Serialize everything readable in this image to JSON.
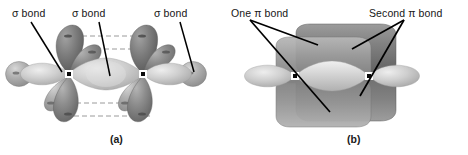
{
  "figure": {
    "background_color": "#ffffff",
    "rendering": "grayscale"
  },
  "panels": [
    {
      "id": "a",
      "caption": "(a)",
      "caption_x": 110,
      "caption_y": 134,
      "description": "sp hybrid orbitals forming three sigma bonds along the molecular axis, with unhybridized p orbitals shown above and below",
      "labels": [
        {
          "text": "σ bond",
          "x": 12,
          "y": 8,
          "leader_to_x": 66,
          "leader_to_y": 74
        },
        {
          "text": "σ bond",
          "x": 72,
          "y": 8,
          "leader_to_x": 106,
          "leader_to_y": 78
        },
        {
          "text": "σ bond",
          "x": 155,
          "y": 8,
          "leader_to_x": 190,
          "leader_to_y": 74
        }
      ],
      "nuclei": [
        {
          "x": 69,
          "y": 74
        },
        {
          "x": 143,
          "y": 74
        }
      ],
      "sigma_lobes": [
        {
          "name": "terminal-hydrogen-left",
          "cx": 19,
          "cy": 74,
          "rx": 13,
          "ry": 12,
          "shade": "#9d9d9d"
        },
        {
          "name": "sp-lobe-left-outer",
          "cx": 44,
          "cy": 74,
          "rx": 22,
          "ry": 14,
          "shade": "#c2c2c2"
        },
        {
          "name": "sp-lobe-center-left",
          "cx": 92,
          "cy": 75,
          "rx": 25,
          "ry": 14,
          "shade": "#c8c8c8"
        },
        {
          "name": "sp-lobe-center-right",
          "cx": 120,
          "cy": 75,
          "rx": 25,
          "ry": 14,
          "shade": "#c8c8c8"
        },
        {
          "name": "sp-lobe-right-outer",
          "cx": 168,
          "cy": 74,
          "rx": 22,
          "ry": 14,
          "shade": "#c2c2c2"
        },
        {
          "name": "terminal-hydrogen-right",
          "cx": 193,
          "cy": 74,
          "rx": 13,
          "ry": 12,
          "shade": "#9d9d9d"
        }
      ],
      "p_orbitals": [
        {
          "name": "p-left-upper-back",
          "cx": 66,
          "cy": 48,
          "tilt": -12,
          "shade": "#6f6f6f"
        },
        {
          "name": "p-left-upper-front",
          "cx": 82,
          "cy": 55,
          "tilt": 18,
          "shade": "#8a8a8a"
        },
        {
          "name": "p-left-lower-front",
          "cx": 70,
          "cy": 100,
          "tilt": 12,
          "shade": "#7a7a7a"
        },
        {
          "name": "p-left-lower-back",
          "cx": 55,
          "cy": 95,
          "tilt": -16,
          "shade": "#8d8d8d"
        },
        {
          "name": "p-right-upper-back",
          "cx": 140,
          "cy": 48,
          "tilt": -12,
          "shade": "#6f6f6f"
        },
        {
          "name": "p-right-upper-front",
          "cx": 156,
          "cy": 55,
          "tilt": 18,
          "shade": "#8a8a8a"
        },
        {
          "name": "p-right-lower-front",
          "cx": 144,
          "cy": 100,
          "tilt": 12,
          "shade": "#7a7a7a"
        },
        {
          "name": "p-right-lower-back",
          "cx": 129,
          "cy": 95,
          "tilt": -16,
          "shade": "#8d8d8d"
        }
      ],
      "dashed_connectors": [
        {
          "x1": 74,
          "y1": 36,
          "x2": 148,
          "y2": 36
        },
        {
          "x1": 88,
          "y1": 48,
          "x2": 162,
          "y2": 48
        },
        {
          "x1": 62,
          "y1": 102,
          "x2": 136,
          "y2": 102
        },
        {
          "x1": 76,
          "y1": 115,
          "x2": 150,
          "y2": 115
        }
      ],
      "dash_color": "#9a9a9a"
    },
    {
      "id": "b",
      "caption": "(b)",
      "caption_x": 347,
      "caption_y": 134,
      "description": "two pi bonds forming cylindrical electron clouds above and below the sigma framework",
      "labels": [
        {
          "text": "One π bond",
          "x": 232,
          "y": 8
        },
        {
          "text": "Second π bond",
          "x": 372,
          "y": 8
        }
      ],
      "nuclei": [
        {
          "x": 295,
          "y": 76
        },
        {
          "x": 369,
          "y": 76
        }
      ],
      "pi_clouds": [
        {
          "name": "pi-cloud-upper",
          "x": 292,
          "y": 32,
          "w": 100,
          "h": 42,
          "shade": "#7d7d7d"
        },
        {
          "name": "pi-cloud-lower",
          "x": 292,
          "y": 80,
          "w": 100,
          "h": 42,
          "shade": "#6e6e6e"
        },
        {
          "name": "pi-cloud-upper-front",
          "x": 272,
          "y": 44,
          "w": 96,
          "h": 38,
          "shade": "#9a9a9a"
        },
        {
          "name": "pi-cloud-lower-front",
          "x": 272,
          "y": 86,
          "w": 96,
          "h": 38,
          "shade": "#8a8a8a"
        }
      ],
      "sigma_lobes": [
        {
          "name": "sigma-terminal-left",
          "cx": 262,
          "cy": 76,
          "rx": 26,
          "ry": 13,
          "shade": "#c9c9c9"
        },
        {
          "name": "sigma-center",
          "cx": 332,
          "cy": 76,
          "rx": 40,
          "ry": 14,
          "shade": "#d2d2d2"
        },
        {
          "name": "sigma-terminal-right",
          "cx": 402,
          "cy": 76,
          "rx": 26,
          "ry": 13,
          "shade": "#c9c9c9"
        }
      ]
    }
  ],
  "colors": {
    "label_text": "#161616",
    "leader_line": "#000000",
    "nucleus_fill": "#0a0a0a",
    "nucleus_border": "#ffffff",
    "p_orbital_dark": "#6f6f6f",
    "p_orbital_mid": "#8a8a8a",
    "sigma_orbital_light": "#c8c8c8",
    "pi_cloud": "#7d7d7d"
  }
}
